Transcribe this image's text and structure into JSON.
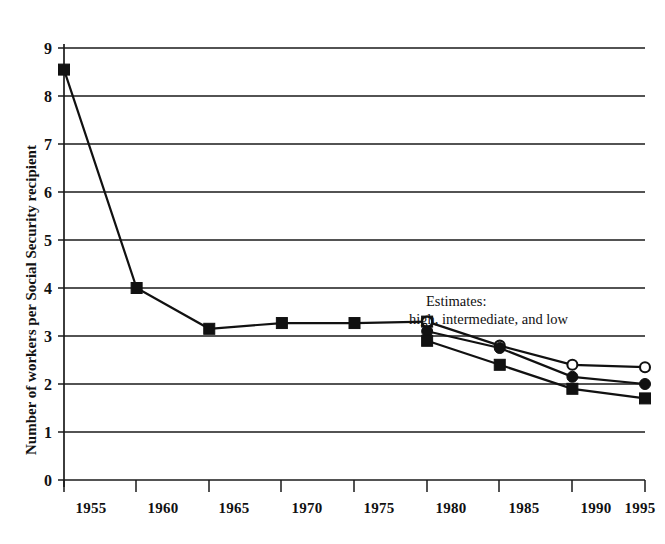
{
  "chart_data": {
    "type": "line",
    "title": "",
    "xlabel": "",
    "ylabel": "Number of workers per Social Security recipient",
    "xlim": [
      1955,
      1995
    ],
    "ylim": [
      0,
      9
    ],
    "grid": true,
    "legend_position": "none",
    "x_ticks": [
      "1955",
      "1960",
      "1965",
      "1970",
      "1975",
      "1980",
      "1985",
      "1990",
      "1995"
    ],
    "y_ticks": [
      "0",
      "1",
      "2",
      "3",
      "4",
      "5",
      "6",
      "7",
      "8",
      "9"
    ],
    "annotations": [
      {
        "name": "estimates-annotation-line1",
        "text": "Estimates:"
      },
      {
        "name": "estimates-annotation-line2",
        "text": "high, intermediate, and low"
      }
    ],
    "categories": [
      1955,
      1960,
      1965,
      1970,
      1975,
      1980,
      1985,
      1990,
      1995
    ],
    "series": [
      {
        "name": "historical",
        "marker": "filled-square",
        "x": [
          1955,
          1960,
          1965,
          1970,
          1975,
          1980
        ],
        "values": [
          8.55,
          4.0,
          3.15,
          3.27,
          3.27,
          3.3
        ]
      },
      {
        "name": "high",
        "marker": "open-circle",
        "x": [
          1980,
          1985,
          1990,
          1995
        ],
        "values": [
          3.3,
          2.8,
          2.4,
          2.35
        ]
      },
      {
        "name": "intermediate",
        "marker": "filled-circle",
        "x": [
          1980,
          1985,
          1990,
          1995
        ],
        "values": [
          3.1,
          2.75,
          2.15,
          2.0
        ]
      },
      {
        "name": "low",
        "marker": "filled-square",
        "x": [
          1980,
          1985,
          1990,
          1995
        ],
        "values": [
          2.9,
          2.4,
          1.9,
          1.7
        ]
      }
    ]
  },
  "colors": {
    "ink": "#111111",
    "background": "#ffffff",
    "gridline": "#1a1a1a"
  }
}
